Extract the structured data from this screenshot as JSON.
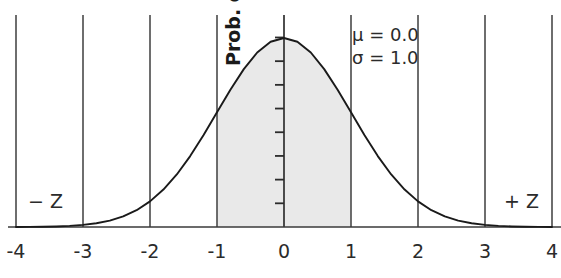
{
  "chart_data": {
    "type": "area",
    "title": "",
    "subtitle": "",
    "xlabel": "",
    "ylabel": "Prob. density",
    "xlim": [
      -4,
      4
    ],
    "ylim": [
      0,
      0.45
    ],
    "grid": true,
    "legend_position": "none",
    "distribution": "normal",
    "parameters": {
      "mu": 0.0,
      "sigma": 1.0,
      "mu_text": "μ = 0.0",
      "sigma_text": "σ = 1.0"
    },
    "x_ticks": [
      -4,
      -3,
      -2,
      -1,
      0,
      1,
      2,
      3,
      4
    ],
    "x_tick_labels": [
      "-4",
      "-3",
      "-2",
      "-1",
      "0",
      "1",
      "2",
      "3",
      "4"
    ],
    "y_ticks": [
      0.05,
      0.1,
      0.15,
      0.2,
      0.25,
      0.3,
      0.35,
      0.4
    ],
    "y_tick_labels": [
      "",
      "",
      "",
      "",
      "",
      "",
      "",
      ""
    ],
    "shaded_region": {
      "from": -1,
      "to": 1,
      "fill_color": "#e9e9e9",
      "label": ""
    },
    "curve_color": "#1a1a1a",
    "gridline_color": "#4a4a4a",
    "axis_color": "#3a3a3a",
    "annotations": [
      {
        "text": "− Z",
        "x": -3.6,
        "y": 0.06
      },
      {
        "text": "+ Z",
        "x": 3.55,
        "y": 0.06
      },
      {
        "text": "μ = 0.0",
        "x": 1.15,
        "y": 0.41
      },
      {
        "text": "σ = 1.0",
        "x": 1.15,
        "y": 0.375
      }
    ],
    "series": [
      {
        "name": "Standard normal PDF",
        "x": [
          -4.0,
          -3.8,
          -3.6,
          -3.4,
          -3.2,
          -3.0,
          -2.8,
          -2.6,
          -2.4,
          -2.2,
          -2.0,
          -1.8,
          -1.6,
          -1.4,
          -1.2,
          -1.0,
          -0.8,
          -0.6,
          -0.4,
          -0.2,
          0.0,
          0.2,
          0.4,
          0.6,
          0.8,
          1.0,
          1.2,
          1.4,
          1.6,
          1.8,
          2.0,
          2.2,
          2.4,
          2.6,
          2.8,
          3.0,
          3.2,
          3.4,
          3.6,
          3.8,
          4.0
        ],
        "values": [
          0.0001,
          0.0003,
          0.0006,
          0.0012,
          0.0024,
          0.0044,
          0.0079,
          0.0136,
          0.0224,
          0.0355,
          0.054,
          0.079,
          0.1109,
          0.1497,
          0.1942,
          0.242,
          0.2897,
          0.3332,
          0.3683,
          0.391,
          0.3989,
          0.391,
          0.3683,
          0.3332,
          0.2897,
          0.242,
          0.1942,
          0.1497,
          0.1109,
          0.079,
          0.054,
          0.0355,
          0.0224,
          0.0136,
          0.0079,
          0.0044,
          0.0024,
          0.0012,
          0.0006,
          0.0003,
          0.0001
        ]
      }
    ]
  },
  "axis": {
    "y_label": "Prob. density"
  },
  "labels": {
    "minus_z": "− Z",
    "plus_z": "+ Z"
  },
  "params": {
    "mu": "μ = 0.0",
    "sigma": "σ = 1.0"
  },
  "x_tick_labels": {
    "t0": "-4",
    "t1": "-3",
    "t2": "-2",
    "t3": "-1",
    "t4": "0",
    "t5": "1",
    "t6": "2",
    "t7": "3",
    "t8": "4"
  }
}
